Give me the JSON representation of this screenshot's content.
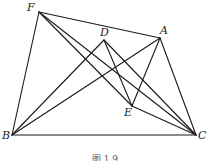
{
  "figure": {
    "points": {
      "F": {
        "label": "F"
      },
      "D": {
        "label": "D"
      },
      "A": {
        "label": "A"
      },
      "E": {
        "label": "E"
      },
      "B": {
        "label": "B"
      },
      "C": {
        "label": "C"
      }
    },
    "segments": [
      [
        "F",
        "B"
      ],
      [
        "F",
        "A"
      ],
      [
        "F",
        "E"
      ],
      [
        "F",
        "C"
      ],
      [
        "B",
        "C"
      ],
      [
        "B",
        "D"
      ],
      [
        "B",
        "A"
      ],
      [
        "D",
        "E"
      ],
      [
        "D",
        "C"
      ],
      [
        "A",
        "E"
      ],
      [
        "A",
        "C"
      ],
      [
        "E",
        "C"
      ]
    ],
    "caption": "图 1.9",
    "line_color": "#1a1a1a"
  }
}
